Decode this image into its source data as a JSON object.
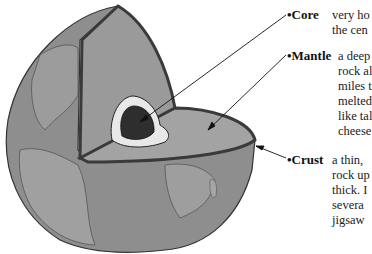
{
  "diagram": {
    "layers": [
      {
        "name": "•Core",
        "description": "very ho\nthe cen"
      },
      {
        "name": "•Mantle",
        "description": "a deep\nrock al\nmiles t\nmelted\nlike tal\ncheese"
      },
      {
        "name": "•Crust",
        "description": "a thin,\nrock up\nthick. I\nsevera\njigsaw"
      }
    ]
  },
  "colors": {
    "globe_surface": "#8c8c8c",
    "continent": "#9a9a9a",
    "mantle": "#999999",
    "outer_core": "#e6e6e6",
    "inner_core": "#333333",
    "crust_border": "#4a4a4a"
  }
}
